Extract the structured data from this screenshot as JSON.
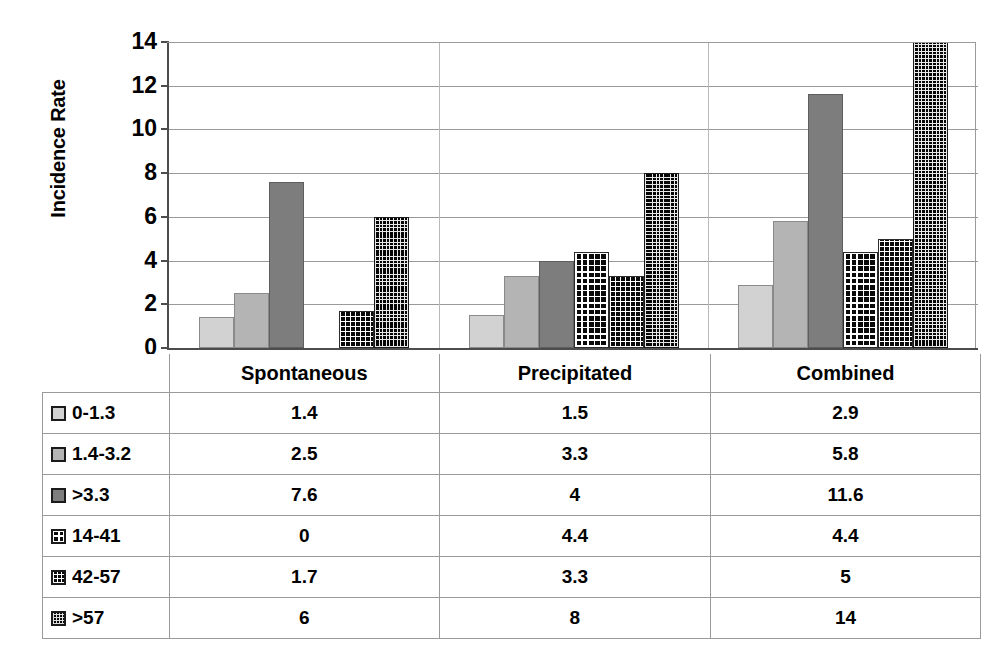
{
  "chart_data": {
    "type": "bar",
    "title": "",
    "xlabel": "",
    "ylabel": "Incidence Rate",
    "ylim": [
      0,
      14
    ],
    "ytick_labels": [
      "14",
      "12",
      "10",
      "8",
      "6",
      "4",
      "2",
      "0"
    ],
    "ytick_values": [
      14,
      12,
      10,
      8,
      6,
      4,
      2,
      0
    ],
    "grid": true,
    "legend_position": "data-table",
    "categories": [
      "Spontaneous",
      "Precipitated",
      "Combined"
    ],
    "series": [
      {
        "name": "0-1.3",
        "values": [
          1.4,
          1.5,
          2.9
        ],
        "swatch": "light-gray-solid"
      },
      {
        "name": "1.4-3.2",
        "values": [
          2.5,
          3.3,
          5.8
        ],
        "swatch": "medium-gray-solid"
      },
      {
        "name": ">3.3",
        "values": [
          7.6,
          4,
          11.6
        ],
        "swatch": "dark-gray-solid"
      },
      {
        "name": "14-41",
        "values": [
          0,
          4.4,
          4.4
        ],
        "swatch": "black-coarse-grid"
      },
      {
        "name": "42-57",
        "values": [
          1.7,
          3.3,
          5
        ],
        "swatch": "black-medium-grid"
      },
      {
        "name": ">57",
        "values": [
          6,
          8,
          14
        ],
        "swatch": "black-fine-grid"
      }
    ],
    "display_values": [
      [
        "1.4",
        "1.5",
        "2.9"
      ],
      [
        "2.5",
        "3.3",
        "5.8"
      ],
      [
        "7.6",
        "4",
        "11.6"
      ],
      [
        "0",
        "4.4",
        "4.4"
      ],
      [
        "1.7",
        "3.3",
        "5"
      ],
      [
        "6",
        "8",
        "14"
      ]
    ]
  },
  "axis": {
    "y_title": "Incidence Rate",
    "y_ticks": [
      "14",
      "12",
      "10",
      "8",
      "6",
      "4",
      "2",
      "0"
    ]
  },
  "data_table": {
    "header": [
      "",
      "Spontaneous",
      "Precipitated",
      "Combined"
    ],
    "rows": [
      {
        "label": "0-1.3",
        "cells": [
          "1.4",
          "1.5",
          "2.9"
        ]
      },
      {
        "label": "1.4-3.2",
        "cells": [
          "2.5",
          "3.3",
          "5.8"
        ]
      },
      {
        "label": ">3.3",
        "cells": [
          "7.6",
          "4",
          "11.6"
        ]
      },
      {
        "label": "14-41",
        "cells": [
          "0",
          "4.4",
          "4.4"
        ]
      },
      {
        "label": "42-57",
        "cells": [
          "1.7",
          "3.3",
          "5"
        ]
      },
      {
        "label": ">57",
        "cells": [
          "6",
          "8",
          "14"
        ]
      }
    ]
  },
  "colors": {
    "series_0": "#d2d2d2",
    "series_1": "#b4b4b4",
    "series_2": "#7d7d7d",
    "series_3": "#0a0a0a",
    "series_4": "#0a0a0a",
    "series_5": "#050505",
    "gridline": "#9a9a9a",
    "axis": "#4d4d4d"
  }
}
